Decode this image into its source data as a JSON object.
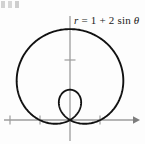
{
  "figure": {
    "title": "",
    "equation_label": {
      "full_text": "r = 1 + 2 sin θ",
      "variable": "r",
      "equals": "=",
      "constant": "1",
      "plus": "+",
      "coefficient": "2",
      "function": "sin",
      "angle": "θ"
    },
    "colors": {
      "curve": "#111111",
      "axis": "#9a9a9a",
      "background": "#fdfdfd",
      "text": "#1a1a1a"
    }
  },
  "chart_data": {
    "type": "line",
    "plot_kind": "polar",
    "title": "",
    "xlabel": "",
    "ylabel": "",
    "annotations": [
      "r = 1 + 2 sin θ"
    ],
    "legend": [],
    "grid": false,
    "axis_arrows": {
      "x_positive": true,
      "y_positive": false
    },
    "polar_equation": {
      "form": "r = a + b*sin(theta)",
      "a": 1,
      "b": 2,
      "name": "limacon with inner loop",
      "theta_min_deg": 0,
      "theta_max_deg": 360
    },
    "key_points": [
      {
        "label": "maximum r at theta = 90°",
        "theta_deg": 90,
        "r": 3,
        "x": 0,
        "y": 3
      },
      {
        "label": "r at theta = 0°",
        "theta_deg": 0,
        "r": 1,
        "x": 1,
        "y": 0
      },
      {
        "label": "r at theta = 180°",
        "theta_deg": 180,
        "r": 1,
        "x": -1,
        "y": 0
      },
      {
        "label": "inner loop tip at theta = 270°",
        "theta_deg": 270,
        "r": -1,
        "x": 0,
        "y": 1
      },
      {
        "label": "pole / cusp crossing",
        "theta_deg": 210,
        "r": 0,
        "x": 0,
        "y": 0
      },
      {
        "label": "pole / cusp crossing",
        "theta_deg": 330,
        "r": 0,
        "x": 0,
        "y": 0
      }
    ],
    "xlim": [
      -2.2,
      2.3
    ],
    "ylim": [
      -0.6,
      3.6
    ],
    "x_ticks": [
      -2,
      -1,
      1
    ],
    "y_ticks": [
      2
    ],
    "series": [
      {
        "name": "r = 1 + 2 sin θ",
        "color": "#111111",
        "closed": true
      }
    ]
  },
  "icons": {
    "x_axis_arrow": "arrow-right-icon"
  }
}
